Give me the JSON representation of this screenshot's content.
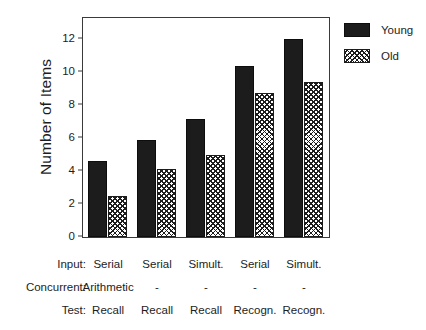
{
  "chart_data": {
    "type": "bar",
    "title": "",
    "subtitle": "",
    "xlabel": "",
    "ylabel": "Number of Items",
    "ylim": [
      0,
      13.2
    ],
    "yticks": [
      0,
      2,
      4,
      6,
      8,
      10,
      12
    ],
    "ytick_labels": [
      "0",
      "2",
      "4",
      "6",
      "8",
      "10",
      "12"
    ],
    "grid": false,
    "legend_position": "right",
    "categories": [
      "1",
      "2",
      "3",
      "4",
      "5"
    ],
    "series": [
      {
        "name": "Young",
        "values": [
          4.6,
          5.9,
          7.15,
          10.35,
          12.0
        ],
        "fill": "solid",
        "color": "#1c1c1c"
      },
      {
        "name": "Old",
        "values": [
          2.5,
          4.1,
          5.0,
          8.7,
          9.4
        ],
        "fill": "cross-hatch",
        "color": "#1c1c1c"
      }
    ],
    "condition_rows": [
      {
        "header": "Input:",
        "values": [
          "Serial",
          "Serial",
          "Simult.",
          "Serial",
          "Simult."
        ]
      },
      {
        "header": "Concurrent:",
        "values": [
          "Arithmetic",
          "-",
          "-",
          "-",
          "-"
        ]
      },
      {
        "header": "Test:",
        "values": [
          "Recall",
          "Recall",
          "Recall",
          "Recogn.",
          "Recogn."
        ]
      }
    ]
  },
  "legend": {
    "items": [
      {
        "label": "Young",
        "swatch": "solid-black-swatch"
      },
      {
        "label": "Old",
        "swatch": "cross-hatch-swatch"
      }
    ]
  },
  "colors": {
    "young": "#1c1c1c",
    "old_outline": "#1c1c1c",
    "axis": "#3a3a3a",
    "text": "#1d1d1d",
    "background": "#ffffff"
  }
}
